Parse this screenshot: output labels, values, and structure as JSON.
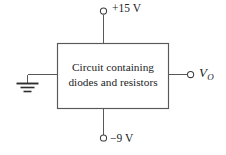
{
  "figure": {
    "type": "circuit-block-diagram",
    "background_color": "#ffffff",
    "line_color": "#58585a",
    "text_color": "#232325"
  },
  "block": {
    "label_line_1": "Circuit containing",
    "label_line_2": "diodes and resistors"
  },
  "terminals": {
    "supply_positive": {
      "label": "+15 V",
      "position": "top",
      "marker": "open-circle-terminal"
    },
    "supply_negative": {
      "label": "−9 V",
      "position": "bottom",
      "marker": "open-circle-terminal"
    },
    "output": {
      "label_symbol": "V",
      "label_subscript": "O",
      "position": "right",
      "marker": "open-circle-terminal"
    },
    "ground": {
      "position": "left",
      "marker": "ground-symbol",
      "label": ""
    }
  }
}
